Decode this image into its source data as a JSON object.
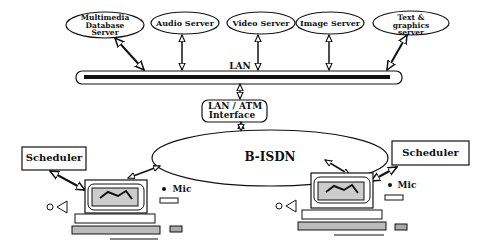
{
  "servers": [
    {
      "id": "multimedia",
      "label": "Multimedia Database Server"
    },
    {
      "id": "audio",
      "label": "Audio Server"
    },
    {
      "id": "video",
      "label": "Video Server"
    },
    {
      "id": "image",
      "label": "Image Server"
    },
    {
      "id": "text",
      "label": "Text & graphics server"
    }
  ],
  "network": {
    "lan": "LAN",
    "interface_line1": "LAN / ATM",
    "interface_line2": "Interface",
    "bisdn": "B-ISDN"
  },
  "left_station": {
    "scheduler": "Scheduler",
    "mic": "Mic"
  },
  "right_station": {
    "scheduler": "Scheduler",
    "mic": "Mic"
  }
}
